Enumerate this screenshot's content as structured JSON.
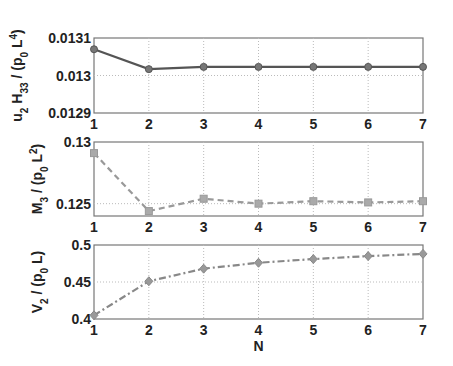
{
  "chart_data": [
    {
      "type": "line",
      "ylabel": "u2 H33 / (p0 L^4)",
      "ylabel_parts": {
        "a": "u",
        "a_sub": "2",
        "b": " H",
        "b_sub": "33",
        "c": " / (p",
        "c_sub": "0",
        "d": " L",
        "d_sup": "4",
        "e": ")"
      },
      "xlabel": "",
      "x": [
        1,
        2,
        3,
        4,
        5,
        6,
        7
      ],
      "values": [
        0.01307,
        0.013017,
        0.013023,
        0.013023,
        0.013023,
        0.013023,
        0.013023
      ],
      "ylim": [
        0.0129,
        0.0131
      ],
      "yticks": [
        "0.0129",
        "0.013",
        "0.0131"
      ],
      "xticks": [
        "1",
        "2",
        "3",
        "4",
        "5",
        "6",
        "7"
      ],
      "line_style": "solid",
      "marker": "circle",
      "color": "#555555",
      "grid": true
    },
    {
      "type": "line",
      "ylabel": "M3 / (p0 L^2)",
      "ylabel_parts": {
        "a": "M",
        "a_sub": "3",
        "c": " / (p",
        "c_sub": "0",
        "d": " L",
        "d_sup": "2",
        "e": ")"
      },
      "xlabel": "",
      "x": [
        1,
        2,
        3,
        4,
        5,
        6,
        7
      ],
      "values": [
        0.1291,
        0.1244,
        0.1254,
        0.125,
        0.1252,
        0.1251,
        0.1252
      ],
      "ylim": [
        0.124,
        0.13
      ],
      "yticks": [
        "0.125",
        "0.13"
      ],
      "xticks": [
        "1",
        "2",
        "3",
        "4",
        "5",
        "6",
        "7"
      ],
      "line_style": "dashed",
      "marker": "square",
      "color": "#999999",
      "grid": true
    },
    {
      "type": "line",
      "ylabel": "V2 / (p0 L)",
      "ylabel_parts": {
        "a": "V",
        "a_sub": "2",
        "c": " / (p",
        "c_sub": "0",
        "d": " L)"
      },
      "xlabel": "N",
      "x": [
        1,
        2,
        3,
        4,
        5,
        6,
        7
      ],
      "values": [
        0.405,
        0.451,
        0.468,
        0.476,
        0.481,
        0.485,
        0.488
      ],
      "ylim": [
        0.4,
        0.5
      ],
      "yticks": [
        "0.4",
        "0.45",
        "0.5"
      ],
      "xticks": [
        "1",
        "2",
        "3",
        "4",
        "5",
        "6",
        "7"
      ],
      "line_style": "dashdot",
      "marker": "diamond",
      "color": "#888888",
      "grid": true
    }
  ]
}
